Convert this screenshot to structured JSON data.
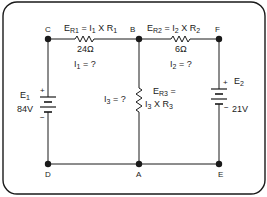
{
  "diagram": {
    "type": "circuit-schematic",
    "nodes": {
      "C": "C",
      "B": "B",
      "F": "F",
      "D": "D",
      "A": "A",
      "E": "E"
    },
    "resistors": [
      {
        "id": "R1",
        "value": "24Ω",
        "equation_main": "E",
        "equation_sub1": "R1",
        "equation_rest": " = I",
        "equation_sub2": "1",
        "equation_tail": " X R",
        "equation_sub3": "1",
        "current_main": "I",
        "current_sub": "1",
        "current_rest": " = ?"
      },
      {
        "id": "R2",
        "value": "6Ω",
        "equation_main": "E",
        "equation_sub1": "R2",
        "equation_rest": " = I",
        "equation_sub2": "2",
        "equation_tail": " X R",
        "equation_sub3": "2",
        "current_main": "I",
        "current_sub": "2",
        "current_rest": " = ?"
      },
      {
        "id": "R3",
        "equation_line1_main": "E",
        "equation_line1_sub": "R3",
        "equation_line1_rest": " =",
        "equation_line2_main": "I",
        "equation_line2_sub": "3",
        "equation_line2_rest": " X R",
        "equation_line2_sub2": "3",
        "current_main": "I",
        "current_sub": "3",
        "current_rest": " = ?"
      }
    ],
    "sources": [
      {
        "id": "E1",
        "name_main": "E",
        "name_sub": "1",
        "voltage": "84V",
        "plus": "+",
        "minus": "−"
      },
      {
        "id": "E2",
        "name_main": "E",
        "name_sub": "2",
        "voltage": "21V",
        "plus": "+",
        "minus": "−"
      }
    ],
    "colors": {
      "line": "#1a1a1a",
      "background": "#ffffff"
    }
  }
}
